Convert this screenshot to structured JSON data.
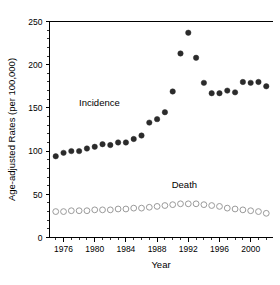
{
  "chart_data": {
    "type": "scatter",
    "title": "",
    "xlabel": "Year",
    "ylabel": "Age-adjusted Rates (per 100,000)",
    "xlim": [
      1974.2,
      2002.8
    ],
    "ylim": [
      0,
      250
    ],
    "ytick_values": [
      0,
      50,
      100,
      150,
      200,
      250
    ],
    "ytick_labels": [
      "0",
      "50",
      "100",
      "150",
      "200",
      "250"
    ],
    "xtick_values": [
      1976,
      1980,
      1984,
      1988,
      1992,
      1996,
      2000
    ],
    "xtick_labels": [
      "1976",
      "1980",
      "1984",
      "1988",
      "1992",
      "1996",
      "2000"
    ],
    "x_minor_step": 1,
    "grid": false,
    "legend_position": "inline-annotation",
    "x": [
      1975,
      1976,
      1977,
      1978,
      1979,
      1980,
      1981,
      1982,
      1983,
      1984,
      1985,
      1986,
      1987,
      1988,
      1989,
      1990,
      1991,
      1992,
      1993,
      1994,
      1995,
      1996,
      1997,
      1998,
      1999,
      2000,
      2001,
      2002
    ],
    "series": [
      {
        "name": "Incidence",
        "marker": "filled-circle",
        "color": "#2b2b2b",
        "annotation": "Incidence",
        "annotation_x": 1980.6,
        "annotation_y": 152,
        "values": [
          94,
          98,
          100,
          100,
          103,
          105,
          108,
          107,
          110,
          110,
          114,
          118,
          133,
          137,
          145,
          169,
          213,
          237,
          208,
          179,
          167,
          167,
          170,
          168,
          180,
          179,
          180,
          175
        ]
      },
      {
        "name": "Death",
        "marker": "open-circle",
        "color": "#9a9a9a",
        "annotation": "Death",
        "annotation_x": 1991.5,
        "annotation_y": 57,
        "values": [
          30,
          30,
          31,
          31,
          31,
          32,
          32,
          32,
          33,
          33,
          34,
          34,
          35,
          36,
          37,
          38,
          39,
          39,
          39,
          38,
          37,
          36,
          34,
          33,
          32,
          31,
          30,
          28
        ]
      }
    ]
  },
  "axes": {
    "y_label_text": "Age-adjusted Rates (per 100,000)",
    "x_label_text": "Year"
  }
}
